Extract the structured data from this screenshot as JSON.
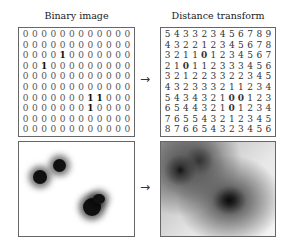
{
  "titles": {
    "left": "Binary image",
    "right": "Distance transform"
  },
  "arrows": {
    "top": "→",
    "bottom": "→"
  },
  "binary_image": [
    [
      0,
      0,
      0,
      0,
      0,
      0,
      0,
      0,
      0,
      0,
      0,
      0
    ],
    [
      0,
      0,
      0,
      0,
      0,
      0,
      0,
      0,
      0,
      0,
      0,
      0
    ],
    [
      0,
      0,
      0,
      0,
      1,
      0,
      0,
      0,
      0,
      0,
      0,
      0
    ],
    [
      0,
      0,
      1,
      0,
      0,
      0,
      0,
      0,
      0,
      0,
      0,
      0
    ],
    [
      0,
      0,
      0,
      0,
      0,
      0,
      0,
      0,
      0,
      0,
      0,
      0
    ],
    [
      0,
      0,
      0,
      0,
      0,
      0,
      0,
      0,
      0,
      0,
      0,
      0
    ],
    [
      0,
      0,
      0,
      0,
      0,
      0,
      0,
      1,
      1,
      0,
      0,
      0
    ],
    [
      0,
      0,
      0,
      0,
      0,
      0,
      0,
      1,
      0,
      0,
      0,
      0
    ],
    [
      0,
      0,
      0,
      0,
      0,
      0,
      0,
      0,
      0,
      0,
      0,
      0
    ],
    [
      0,
      0,
      0,
      0,
      0,
      0,
      0,
      0,
      0,
      0,
      0,
      0
    ]
  ],
  "distance_transform": [
    [
      5,
      4,
      3,
      3,
      2,
      3,
      4,
      5,
      6,
      7,
      8,
      9
    ],
    [
      4,
      3,
      2,
      2,
      1,
      2,
      3,
      4,
      5,
      6,
      7,
      8
    ],
    [
      3,
      2,
      1,
      1,
      0,
      1,
      2,
      3,
      4,
      5,
      6,
      7
    ],
    [
      2,
      1,
      0,
      1,
      1,
      2,
      3,
      3,
      3,
      4,
      5,
      6
    ],
    [
      3,
      2,
      1,
      2,
      2,
      3,
      3,
      2,
      2,
      3,
      4,
      5
    ],
    [
      4,
      3,
      2,
      3,
      3,
      3,
      2,
      1,
      1,
      2,
      3,
      4
    ],
    [
      5,
      4,
      3,
      4,
      3,
      2,
      1,
      0,
      0,
      1,
      2,
      3
    ],
    [
      6,
      5,
      4,
      4,
      3,
      2,
      1,
      0,
      1,
      2,
      3,
      4
    ],
    [
      7,
      6,
      5,
      5,
      4,
      3,
      2,
      1,
      2,
      3,
      4,
      5
    ],
    [
      8,
      7,
      6,
      6,
      5,
      4,
      3,
      2,
      3,
      4,
      5,
      6
    ]
  ],
  "images": {
    "left_caption": "blurred binary image (three dark blobs on white)",
    "right_caption": "distance transform rendered as grayscale"
  }
}
